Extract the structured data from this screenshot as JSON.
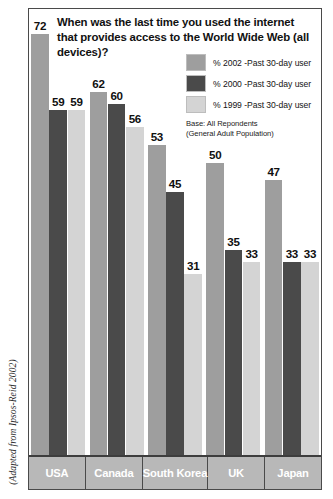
{
  "attribution": "(Adapted from Ipsos-Reid 2002)",
  "title": "When was the last time you used the internet that provides access to the World Wide Web (all devices)?",
  "legend": {
    "entries": [
      {
        "label": "% 2002 -Past 30-day user",
        "color": "#9e9e9e",
        "swatch_name": "legend-swatch-2002"
      },
      {
        "label": "% 2000 -Past 30-day user",
        "color": "#4a4a4a",
        "swatch_name": "legend-swatch-2000"
      },
      {
        "label": "% 1999 -Past 30-day user",
        "color": "#d4d4d4",
        "swatch_name": "legend-swatch-1999"
      }
    ],
    "base_line1": "Base: All Repondents",
    "base_line2": "(General Adult Population)"
  },
  "colors": {
    "series_2002": "#9e9e9e",
    "series_2000": "#4a4a4a",
    "series_1999": "#d4d4d4",
    "frame": "#4a4a4a",
    "category_band": "#b8b8b8",
    "category_text": "#ffffff"
  },
  "chart_data": {
    "type": "bar",
    "title": "When was the last time you used the internet that provides access to the World Wide Web (all devices)?",
    "xlabel": "",
    "ylabel": "",
    "ylim": [
      0,
      80
    ],
    "grid": false,
    "legend_position": "top-right",
    "categories": [
      "USA",
      "Canada",
      "South Korea",
      "UK",
      "Japan"
    ],
    "series": [
      {
        "name": "% 2002 -Past 30-day user",
        "color": "#9e9e9e",
        "values": [
          72,
          62,
          53,
          50,
          47
        ]
      },
      {
        "name": "% 2000 -Past 30-day user",
        "color": "#4a4a4a",
        "values": [
          59,
          60,
          45,
          35,
          33
        ]
      },
      {
        "name": "% 1999 -Past 30-day user",
        "color": "#d4d4d4",
        "values": [
          59,
          56,
          31,
          33,
          33
        ]
      }
    ],
    "annotation": "(Adapted from Ipsos-Reid 2002)",
    "base_note": "Base: All Repondents (General Adult Population)"
  }
}
